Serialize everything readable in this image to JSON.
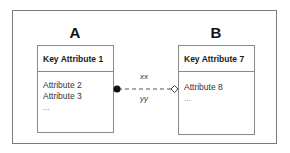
{
  "diagram": {
    "type": "entity-relationship",
    "entities": [
      {
        "id": "A",
        "title": "A",
        "key_attribute": "Key Attribute 1",
        "attributes": [
          "Attribute 2",
          "Attribute 3"
        ],
        "more": "..."
      },
      {
        "id": "B",
        "title": "B",
        "key_attribute": "Key Attribute 7",
        "attributes": [
          "Attribute 8"
        ],
        "more": "..."
      }
    ],
    "relationship": {
      "from": "A",
      "to": "B",
      "label_top": "xx",
      "label_bottom": "yy",
      "line_style": "dashed",
      "start_marker": "filled-circle",
      "end_marker": "open-diamond"
    },
    "colors": {
      "frame_border": "#7a7a7a",
      "box_border": "#8a8a8a",
      "line": "#555555",
      "marker_fill": "#111111"
    }
  }
}
